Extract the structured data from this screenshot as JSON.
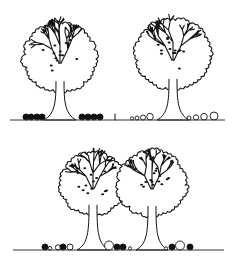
{
  "diagram": {
    "type": "planting-illustration",
    "colors": {
      "ink": "#111111",
      "background": "#ffffff"
    },
    "panels": [
      {
        "id": "top",
        "description": "Two separate trees; left with dark filled shrub clusters, right with hollow graduated circles; short vertical tick marker between them",
        "trees": [
          {
            "cx": 60,
            "crown_top": 22,
            "crown_r": 37,
            "ground_y": 120,
            "understory": "filled",
            "shrubs_left": [
              {
                "x": 26,
                "r": 3
              },
              {
                "x": 31,
                "r": 3
              },
              {
                "x": 37,
                "r": 3
              },
              {
                "x": 42,
                "r": 3
              }
            ],
            "shrubs_right": [
              {
                "x": 82,
                "r": 3
              },
              {
                "x": 88,
                "r": 3
              },
              {
                "x": 94,
                "r": 3
              },
              {
                "x": 100,
                "r": 3
              }
            ]
          },
          {
            "cx": 173,
            "crown_top": 18,
            "crown_r": 38,
            "ground_y": 120,
            "understory": "hollow",
            "shrubs_left": [
              {
                "x": 132,
                "r": 1.6
              },
              {
                "x": 137,
                "r": 2
              },
              {
                "x": 143,
                "r": 2.5
              },
              {
                "x": 150,
                "r": 3.3
              }
            ],
            "shrubs_right": [
              {
                "x": 189,
                "r": 2
              },
              {
                "x": 196,
                "r": 2.6
              },
              {
                "x": 204,
                "r": 3.3
              },
              {
                "x": 214,
                "r": 4
              }
            ]
          }
        ],
        "marker": {
          "x": 115,
          "y1": 114,
          "y2": 120
        }
      },
      {
        "id": "bottom",
        "description": "Two overlapping trees with mixed filled and hollow understory circles",
        "trees": [
          {
            "cx": 93,
            "crown_top": 152,
            "crown_r": 33
          },
          {
            "cx": 152,
            "crown_top": 150,
            "crown_r": 35
          }
        ],
        "ground_y": 250,
        "shrubs": [
          {
            "x": 45,
            "r": 3,
            "fill": "filled"
          },
          {
            "x": 50,
            "r": 1.8,
            "fill": "hollow"
          },
          {
            "x": 58,
            "r": 2.6,
            "fill": "hollow"
          },
          {
            "x": 63,
            "r": 3,
            "fill": "filled"
          },
          {
            "x": 70,
            "r": 3,
            "fill": "hollow"
          },
          {
            "x": 109,
            "r": 4.5,
            "fill": "hollow"
          },
          {
            "x": 117,
            "r": 3,
            "fill": "filled"
          },
          {
            "x": 123,
            "r": 3,
            "fill": "filled"
          },
          {
            "x": 130,
            "r": 1.6,
            "fill": "hollow"
          },
          {
            "x": 166,
            "r": 1.6,
            "fill": "hollow"
          },
          {
            "x": 172,
            "r": 3,
            "fill": "filled"
          },
          {
            "x": 180,
            "r": 4.5,
            "fill": "hollow"
          },
          {
            "x": 190,
            "r": 3,
            "fill": "filled"
          }
        ]
      }
    ]
  }
}
